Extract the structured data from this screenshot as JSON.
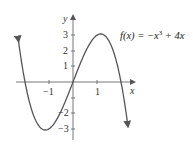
{
  "chart_data": {
    "type": "line",
    "title": "",
    "function_label": "f(x) = −x³ + 4x",
    "equation": {
      "lhs": "f(x) = −x",
      "exponent": "3",
      "rhs": " + 4x"
    },
    "xlabel": "x",
    "ylabel": "y",
    "x_ticks": [
      -1,
      1
    ],
    "x_tick_labels": [
      "−1",
      "1"
    ],
    "y_ticks": [
      -3,
      -2,
      -1,
      1,
      2,
      3
    ],
    "y_tick_labels": [
      "−3",
      "−2",
      "",
      "1",
      "2",
      "3"
    ],
    "xlim": [
      -2.4,
      2.3
    ],
    "ylim": [
      -3.3,
      3.5
    ],
    "grid": false,
    "series": [
      {
        "name": "f(x) = −x³ + 4x",
        "x": [
          -2.2,
          -2.0,
          -1.5,
          -1.15,
          -1.0,
          -0.5,
          0,
          0.5,
          1.0,
          1.15,
          1.5,
          2.0,
          2.2
        ],
        "values": [
          1.85,
          0,
          -2.63,
          -3.08,
          -3,
          -1.88,
          0,
          1.88,
          3,
          3.08,
          2.63,
          0,
          -1.85
        ]
      }
    ],
    "annotations": [
      "arrowheads at both curve ends",
      "x-intercepts at −2, 0, 2",
      "local min ≈ (−1.15, −3.08)",
      "local max ≈ (1.15, 3.08)"
    ],
    "colors": {
      "curve": "#555555",
      "axes": "#777777",
      "text": "#333333"
    }
  }
}
